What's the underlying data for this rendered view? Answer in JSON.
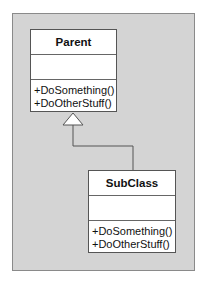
{
  "diagram": {
    "type": "uml-class-inheritance",
    "colors": {
      "frame_bg": "#d4d4d4",
      "box_bg": "#ffffff",
      "line": "#555555"
    },
    "classes": [
      {
        "id": "parent",
        "name": "Parent",
        "attributes": [],
        "operations": [
          "+DoSomething()",
          "+DoOtherStuff()"
        ]
      },
      {
        "id": "sub",
        "name": "SubClass",
        "attributes": [],
        "operations": [
          "+DoSomething()",
          "+DoOtherStuff()"
        ]
      }
    ],
    "relationships": [
      {
        "type": "generalization",
        "from": "SubClass",
        "to": "Parent",
        "arrow": "hollow-triangle"
      }
    ]
  }
}
